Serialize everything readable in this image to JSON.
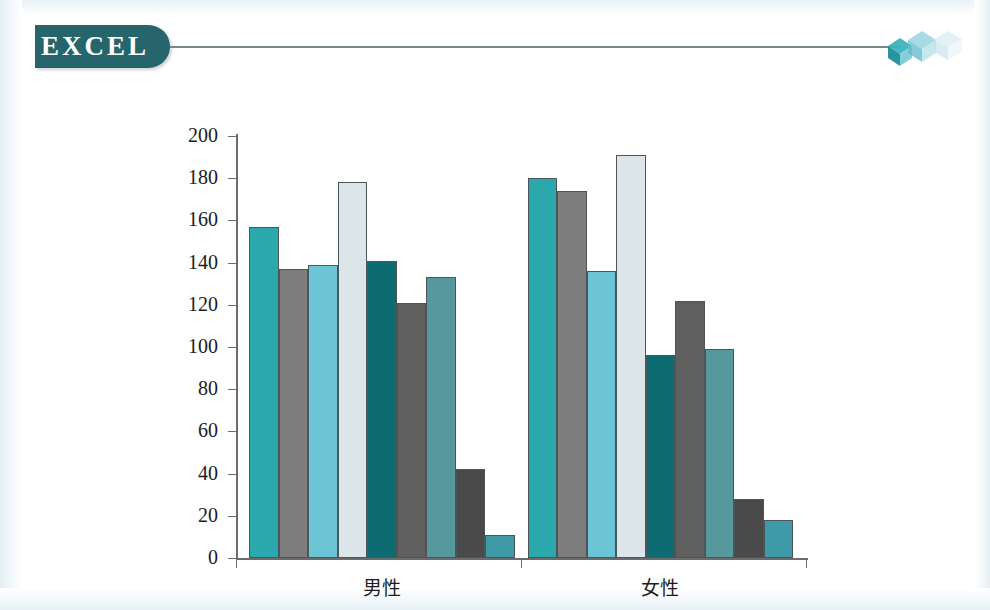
{
  "header": {
    "badge_label": "EXCEL",
    "badge_color": "#26656b",
    "rule_color": "#79878c",
    "cube_icon_name": "cube-cluster-icon",
    "cube_colors": [
      "#2ba3ab",
      "#8fd0dc",
      "#cfe9f1"
    ]
  },
  "chart_data": {
    "type": "bar",
    "title": "",
    "subtitle": "",
    "xlabel": "",
    "ylabel": "",
    "categories": [
      "男性",
      "女性"
    ],
    "ylim": [
      0,
      200
    ],
    "yticks": [
      0,
      20,
      40,
      60,
      80,
      100,
      120,
      140,
      160,
      180,
      200
    ],
    "ytick_labels": [
      "0",
      "20",
      "40",
      "60",
      "80",
      "100",
      "120",
      "140",
      "160",
      "180",
      "200"
    ],
    "grid": false,
    "legend": "none",
    "series": [
      {
        "name": "series-1",
        "color": "#2ba8ab",
        "values": [
          157,
          180
        ]
      },
      {
        "name": "series-2",
        "color": "#7d7d7d",
        "values": [
          137,
          174
        ]
      },
      {
        "name": "series-3",
        "color": "#6cc5d4",
        "values": [
          139,
          136
        ]
      },
      {
        "name": "series-4",
        "color": "#dce5e8",
        "values": [
          178,
          191
        ]
      },
      {
        "name": "series-5",
        "color": "#0d6b72",
        "values": [
          141,
          96
        ]
      },
      {
        "name": "series-6",
        "color": "#5f5f5f",
        "values": [
          121,
          122
        ]
      },
      {
        "name": "series-7",
        "color": "#57989f",
        "values": [
          133,
          99
        ]
      },
      {
        "name": "series-8",
        "color": "#4a4a4a",
        "values": [
          42,
          28
        ]
      },
      {
        "name": "series-9",
        "color": "#3f9aa8",
        "values": [
          11,
          18
        ]
      }
    ]
  }
}
